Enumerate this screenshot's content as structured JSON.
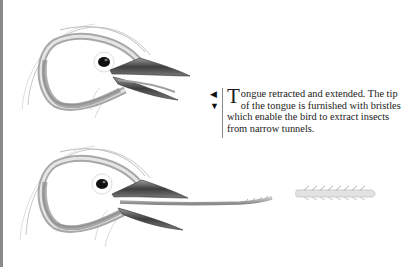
{
  "caption": {
    "dropcap": "T",
    "text": "ongue retracted and extended. The tip of the tongue is furnished with bristles which enable the bird to extract insects from narrow tunnels."
  },
  "indicators": {
    "left_arrow": "◀",
    "down_arrow": "▼"
  },
  "illustrations": [
    {
      "label": "woodpecker-head-tongue-retracted"
    },
    {
      "label": "woodpecker-head-tongue-extended"
    },
    {
      "label": "tongue-tip-bristles-detail"
    }
  ],
  "colors": {
    "beak": "#4a4a4a",
    "tongue": "#9a9a9a",
    "outline": "#b0b0b0",
    "eye": "#111111"
  }
}
